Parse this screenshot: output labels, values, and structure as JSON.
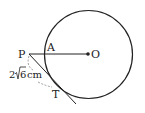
{
  "diagram": {
    "points": {
      "P": "P",
      "A": "A",
      "O": "O",
      "T": "T"
    },
    "length_label": {
      "prefix": "2",
      "radicand": "6",
      "unit": "cm"
    },
    "colors": {
      "stroke": "#222222",
      "dashed": "#888888",
      "background": "#ffffff"
    }
  }
}
